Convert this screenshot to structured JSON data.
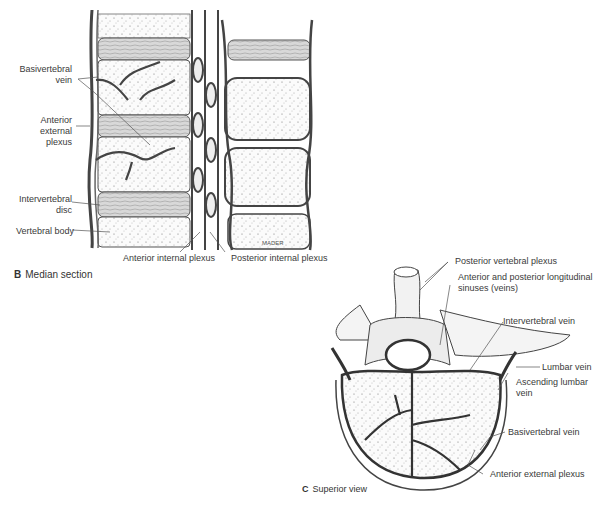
{
  "panel_b": {
    "letter": "B",
    "caption": "Median section",
    "labels": {
      "basivertebral_vein": [
        "Basivertebral",
        "vein"
      ],
      "anterior_external_plexus": [
        "Anterior",
        "external",
        "plexus"
      ],
      "intervertebral_disc": [
        "Intervertebral",
        "disc"
      ],
      "vertebral_body": "Vertebral body",
      "anterior_internal_plexus": "Anterior internal plexus",
      "posterior_internal_plexus": "Posterior internal plexus"
    },
    "signature": "MADER"
  },
  "panel_c": {
    "letter": "C",
    "caption": "Superior view",
    "labels": {
      "posterior_vertebral_plexus": "Posterior vertebral plexus",
      "longitudinal_sinuses": [
        "Anterior and posterior longitudinal",
        "sinuses (veins)"
      ],
      "intervertebral_vein": "Intervertebral vein",
      "lumbar_vein": "Lumbar vein",
      "ascending_lumbar_vein": [
        "Ascending lumbar",
        "vein"
      ],
      "basivertebral_vein": "Basivertebral vein",
      "anterior_external_plexus": "Anterior external plexus"
    }
  }
}
